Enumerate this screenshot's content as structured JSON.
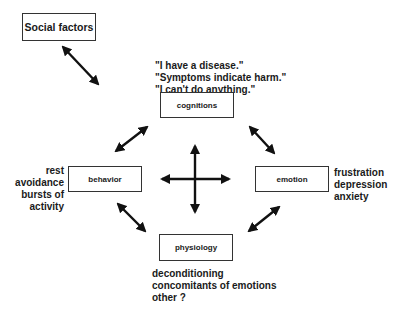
{
  "diagram": {
    "nodes": {
      "social": {
        "label": "Social factors"
      },
      "cognitions": {
        "label": "cognitions"
      },
      "behavior": {
        "label": "behavior"
      },
      "emotion": {
        "label": "emotion"
      },
      "physiology": {
        "label": "physiology"
      }
    },
    "annotations": {
      "cognitions": [
        "\"I have a disease.\"",
        "\"Symptoms indicate harm.\"",
        "\"I can't do anything.\""
      ],
      "behavior": [
        "rest",
        "avoidance",
        "bursts of",
        "activity"
      ],
      "emotion": [
        "frustration",
        "depression",
        "anxiety"
      ],
      "physiology": [
        "deconditioning",
        "concomitants of emotions",
        "other ?"
      ]
    },
    "edges": [
      {
        "from": "social",
        "to": "center",
        "type": "bidirectional"
      },
      {
        "from": "cognitions",
        "to": "behavior",
        "type": "bidirectional"
      },
      {
        "from": "cognitions",
        "to": "emotion",
        "type": "bidirectional"
      },
      {
        "from": "behavior",
        "to": "physiology",
        "type": "bidirectional"
      },
      {
        "from": "emotion",
        "to": "physiology",
        "type": "bidirectional"
      },
      {
        "from": "center",
        "to": "all",
        "type": "four-way-cross"
      }
    ]
  }
}
